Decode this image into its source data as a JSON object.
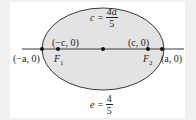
{
  "diagram": {
    "type": "ellipse",
    "colors": {
      "fill": "#e3e3e3",
      "stroke": "#3a3a3a",
      "background": "#f1f1f1",
      "panel": "#ffffff"
    },
    "top_formula": {
      "lhs": "c =",
      "numerator": "4a",
      "denominator": "5"
    },
    "bottom_formula": {
      "lhs": "e =",
      "numerator": "4",
      "denominator": "5"
    },
    "points": [
      {
        "id": "left-vertex",
        "label": "(−a, 0)"
      },
      {
        "id": "left-focus",
        "coord": "(−c, 0)",
        "name": "F",
        "sub": "1"
      },
      {
        "id": "center",
        "label": ""
      },
      {
        "id": "right-focus",
        "coord": "(c, 0)",
        "name": "F",
        "sub": "2"
      },
      {
        "id": "right-vertex",
        "label": "(a, 0)"
      }
    ]
  }
}
